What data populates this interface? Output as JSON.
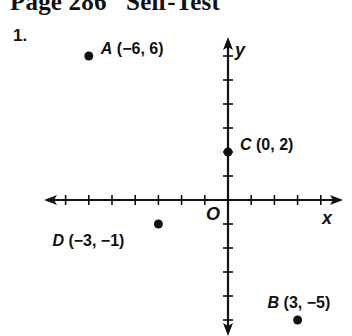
{
  "header": {
    "title": "Page 286   Self-Test",
    "problem_number": "1."
  },
  "chart_data": {
    "type": "scatter",
    "title": "",
    "xlabel": "x",
    "ylabel": "y",
    "origin_label": "O",
    "xlim": [
      -8,
      5
    ],
    "ylim": [
      -6,
      7
    ],
    "x_ticks": [
      -7,
      -6,
      -5,
      -4,
      -3,
      -2,
      -1,
      1,
      2,
      3,
      4
    ],
    "y_ticks": [
      -5,
      -4,
      -3,
      -2,
      -1,
      1,
      2,
      3,
      4,
      5,
      6
    ],
    "grid": false,
    "points": [
      {
        "name": "A",
        "x": -6,
        "y": 6,
        "label": "A (−6, 6)",
        "label_pos": "right-above"
      },
      {
        "name": "B",
        "x": 3,
        "y": -5,
        "label": "B (3, −5)",
        "label_pos": "above"
      },
      {
        "name": "C",
        "x": 0,
        "y": 2,
        "label": "C (0, 2)",
        "label_pos": "right-above"
      },
      {
        "name": "D",
        "x": -3,
        "y": -1,
        "label": "D (−3, −1)",
        "label_pos": "left-below"
      }
    ]
  }
}
